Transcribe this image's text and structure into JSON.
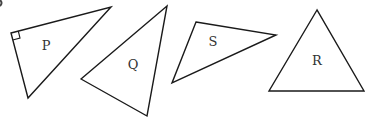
{
  "diagram": {
    "type": "geometry-triangles",
    "stroke_color": "#1a1a1a",
    "label_color": "#333333",
    "triangles": [
      {
        "label": "P",
        "points": "11,33 111,7 28,98",
        "label_pos": [
          46,
          50
        ],
        "right_angle": true
      },
      {
        "label": "Q",
        "points": "81,79 167,6 147,116",
        "label_pos": [
          133,
          69
        ]
      },
      {
        "label": "S",
        "points": "196,22 276,35 172,83",
        "label_pos": [
          213,
          46
        ]
      },
      {
        "label": "R",
        "points": "317,10 269,91 364,91",
        "label_pos": [
          317,
          65
        ]
      }
    ]
  }
}
